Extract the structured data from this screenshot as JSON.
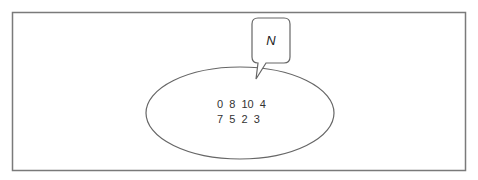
{
  "diagram": {
    "type": "set-diagram",
    "universe_frame": {
      "stroke": "#777777"
    },
    "set": {
      "label": "N",
      "elements_row1": [
        "0",
        "8",
        "10",
        "4"
      ],
      "elements_row2": [
        "7",
        "5",
        "2",
        "3"
      ],
      "row1_text": "0  8  10  4",
      "row2_text": "7  5  2  3",
      "stroke": "#666666"
    },
    "callout": {
      "label": "N",
      "stroke": "#666666"
    }
  }
}
